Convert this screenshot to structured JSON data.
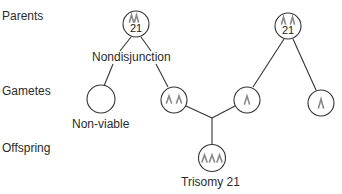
{
  "diagram": {
    "rows": {
      "parents": "Parents",
      "gametes": "Gametes",
      "offspring": "Offspring"
    },
    "parent_1": {
      "chromosome_number": "21",
      "chromosome_copies": 2
    },
    "parent_2": {
      "chromosome_number": "21",
      "chromosome_copies": 2
    },
    "event_label": "Nondisjunction",
    "gametes": [
      {
        "id": "nullisomic",
        "chromosome_copies": 0,
        "label": "Non-viable"
      },
      {
        "id": "disomic",
        "chromosome_copies": 2,
        "label": ""
      },
      {
        "id": "monosomic-a",
        "chromosome_copies": 1,
        "label": ""
      },
      {
        "id": "monosomic-b",
        "chromosome_copies": 1,
        "label": ""
      }
    ],
    "offspring": {
      "chromosome_copies": 3,
      "label": "Trisomy 21"
    },
    "colors": {
      "line": "#333333",
      "chromosome": "#8a8a8a"
    }
  }
}
